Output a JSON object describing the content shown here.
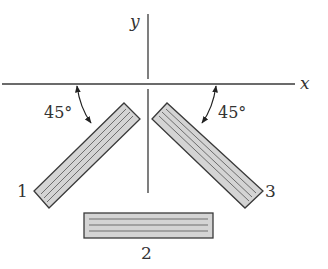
{
  "diagram": {
    "axes": {
      "x_label": "x",
      "y_label": "y"
    },
    "angles": {
      "left": "45°",
      "right": "45°"
    },
    "plates": [
      {
        "id": "1",
        "label": "1",
        "orientation": "inclined 45° (lower-left)"
      },
      {
        "id": "2",
        "label": "2",
        "orientation": "horizontal"
      },
      {
        "id": "3",
        "label": "3",
        "orientation": "inclined 45° (lower-right)"
      }
    ],
    "colors": {
      "line": "#3a3a3a",
      "plate_fill": "#d4d4d4",
      "plate_stripe": "#6e6e6e",
      "text": "#333333"
    }
  }
}
